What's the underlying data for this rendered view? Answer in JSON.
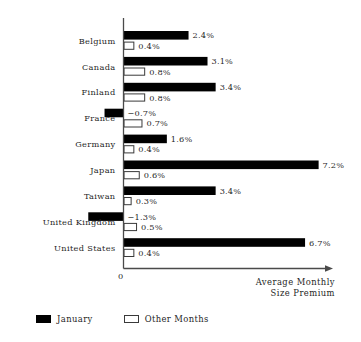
{
  "chart_data": {
    "type": "bar",
    "orientation": "horizontal",
    "title": "",
    "xlabel": "Average Monthly Size Premium",
    "ylabel": "",
    "xlim": [
      -1.6,
      7.8
    ],
    "grid": false,
    "legend_position": "bottom-left",
    "zero_tick_label": "0",
    "categories": [
      "Belgium",
      "Canada",
      "Finland",
      "France",
      "Germany",
      "Japan",
      "Taiwan",
      "United Kingdom",
      "United States"
    ],
    "series": [
      {
        "name": "January",
        "color": "#000000",
        "values": [
          2.4,
          3.1,
          3.4,
          -0.7,
          1.6,
          7.2,
          3.4,
          -1.3,
          6.7
        ],
        "labels": [
          "2.4%",
          "3.1%",
          "3.4%",
          "−0.7%",
          "1.6%",
          "7.2%",
          "3.4%",
          "−1.3%",
          "6.7%"
        ]
      },
      {
        "name": "Other Months",
        "color": "#ffffff",
        "values": [
          0.4,
          0.8,
          0.8,
          0.7,
          0.4,
          0.6,
          0.3,
          0.5,
          0.4
        ],
        "labels": [
          "0.4%",
          "0.8%",
          "0.8%",
          "0.7%",
          "0.4%",
          "0.6%",
          "0.3%",
          "0.5%",
          "0.4%"
        ]
      }
    ]
  },
  "axis": {
    "title_line1": "Average Monthly",
    "title_line2": "Size Premium",
    "zero_label": "0"
  },
  "legend": {
    "items": [
      {
        "label": "January",
        "swatch": "filled-square-icon"
      },
      {
        "label": "Other Months",
        "swatch": "hollow-square-icon"
      }
    ]
  }
}
